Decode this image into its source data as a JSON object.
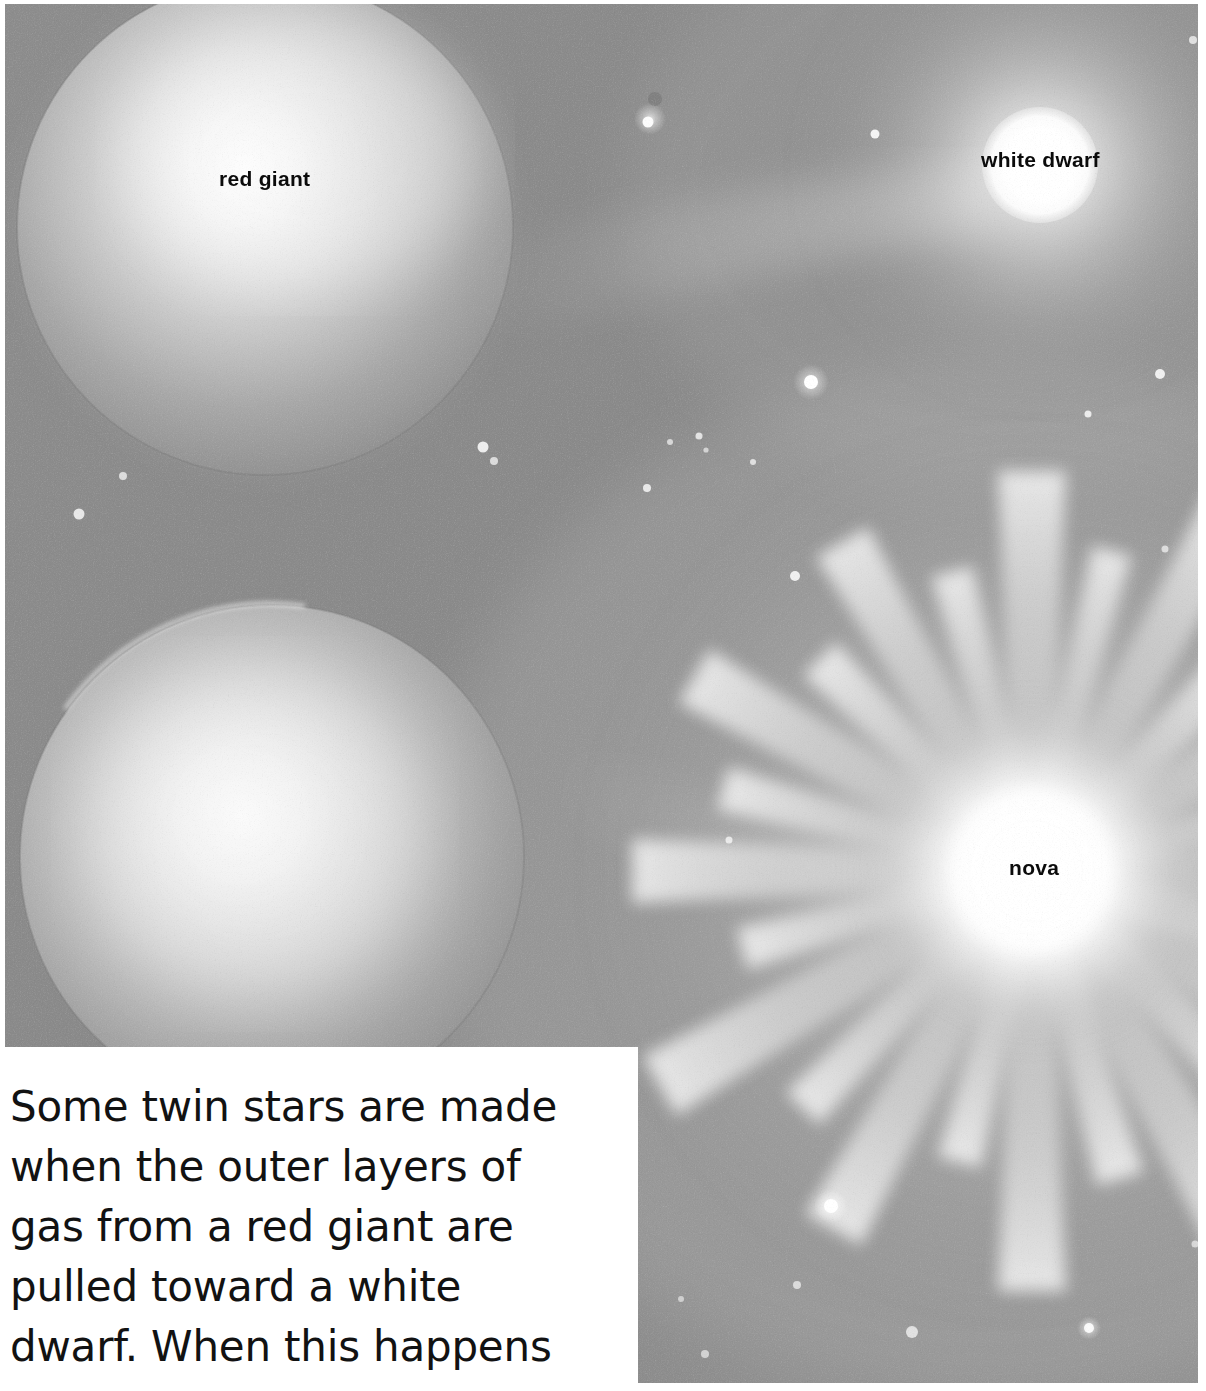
{
  "figure": {
    "kind": "astronomy-illustration",
    "background_color": "#8e8e8e",
    "ink_color": "#0b0b0b",
    "paper_color": "#ffffff"
  },
  "labels": [
    {
      "id": "red-giant",
      "text": "red giant",
      "x": 219,
      "y": 168
    },
    {
      "id": "white-dwarf",
      "text": "white dwarf",
      "x": 981,
      "y": 149
    },
    {
      "id": "nova",
      "text": "nova",
      "x": 1009,
      "y": 857
    }
  ],
  "objects": {
    "red_giant_upper": {
      "label": "red giant",
      "cx": 265,
      "cy": 228,
      "r": 248,
      "glow_color": "#fbfbfb"
    },
    "red_giant_lower": {
      "label": "",
      "cx": 272,
      "cy": 858,
      "r": 252,
      "glow_color": "#f7f7f7"
    },
    "white_dwarf": {
      "label": "white dwarf",
      "cx": 1040,
      "cy": 166,
      "r": 58,
      "halo_r": 230,
      "core_color": "#ffffff"
    },
    "nova": {
      "label": "nova",
      "cx": 1032,
      "cy": 872,
      "core_r": 150,
      "ray_count": 26,
      "ray_length": 430,
      "core_color": "#ffffff"
    }
  },
  "caption": {
    "lines": [
      "Some twin stars are made",
      "when the outer layers of",
      "gas from a red giant are",
      "pulled toward a white",
      "dwarf. When this happens"
    ],
    "full_text": "Some twin stars are made when the outer layers of gas from a red giant are pulled toward a white dwarf. When this happens"
  }
}
